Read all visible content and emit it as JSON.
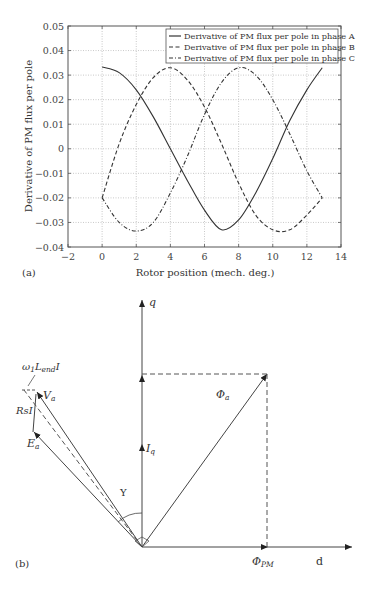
{
  "panel_a": {
    "label": "(a)",
    "ylabel": "Derivative of PM flux per pole",
    "xlabel": "Rotor position (mech. deg.)"
  },
  "panel_b": {
    "label": "(b)",
    "labels": {
      "q_axis": "q",
      "d_axis": "d",
      "phi_a": "Φa",
      "phi_pm": "ΦPM",
      "iq": "Iq",
      "va": "Va",
      "ea": "Ea",
      "rsi": "RsI",
      "wl": "ω1LendI",
      "gamma": "Y"
    }
  },
  "chart_data": [
    {
      "type": "line",
      "title": "",
      "xlabel": "Rotor position (mech. deg.)",
      "ylabel": "Derivative of PM flux per pole",
      "xlim": [
        -2,
        14
      ],
      "ylim": [
        -0.04,
        0.05
      ],
      "xticks": [
        -2,
        0,
        2,
        4,
        6,
        8,
        10,
        12,
        14
      ],
      "yticks": [
        -0.04,
        -0.03,
        -0.02,
        -0.01,
        0,
        0.01,
        0.02,
        0.03,
        0.04,
        0.05
      ],
      "xtick_labels": [
        "−2",
        "0",
        "2",
        "4",
        "6",
        "8",
        "10",
        "12",
        "14"
      ],
      "ytick_labels": [
        "−0.04",
        "−0.03",
        "−0.02",
        "−0.01",
        "0",
        "0.01",
        "0.02",
        "0.03",
        "0.04",
        "0.05"
      ],
      "grid": true,
      "legend_position": "upper right",
      "x": [
        0,
        1,
        2,
        3,
        4,
        5,
        6,
        7,
        8,
        9,
        10,
        11,
        12,
        12.9
      ],
      "series": [
        {
          "name": "Derivative of PM flux per pole  in phase A",
          "style": "solid",
          "values": [
            0.0333,
            0.031,
            0.024,
            0.013,
            0.0,
            -0.013,
            -0.025,
            -0.033,
            -0.029,
            -0.018,
            -0.004,
            0.0115,
            0.024,
            0.033
          ]
        },
        {
          "name": "Derivative of PM flux per pole  in phase B",
          "style": "dashed",
          "values": [
            -0.02,
            0.002,
            0.018,
            0.029,
            0.033,
            0.028,
            0.017,
            0.002,
            -0.014,
            -0.027,
            -0.033,
            -0.033,
            -0.027,
            -0.02
          ]
        },
        {
          "name": "Derivative of PM flux per pole  in phase C",
          "style": "dash-dot",
          "values": [
            -0.02,
            -0.03,
            -0.0335,
            -0.03,
            -0.018,
            -0.003,
            0.014,
            0.027,
            0.033,
            0.03,
            0.02,
            0.006,
            -0.009,
            -0.02
          ]
        }
      ]
    }
  ]
}
